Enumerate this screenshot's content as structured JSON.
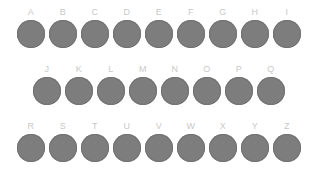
{
  "background_color": "#ffffff",
  "circle_color": "#7d7d7d",
  "circle_edge_color": "#717171",
  "label_color": "#c9c9c9",
  "board": {
    "name": "alphabet-circle-grid",
    "rows": [
      {
        "row_index": 1,
        "left": 17,
        "top": 7,
        "items": [
          {
            "label": "A"
          },
          {
            "label": "B"
          },
          {
            "label": "C"
          },
          {
            "label": "D"
          },
          {
            "label": "E"
          },
          {
            "label": "F"
          },
          {
            "label": "G"
          },
          {
            "label": "H"
          },
          {
            "label": "I"
          }
        ]
      },
      {
        "row_index": 2,
        "left": 33,
        "top": 64,
        "items": [
          {
            "label": "J"
          },
          {
            "label": "K"
          },
          {
            "label": "L"
          },
          {
            "label": "M"
          },
          {
            "label": "N"
          },
          {
            "label": "O"
          },
          {
            "label": "P"
          },
          {
            "label": "Q"
          }
        ]
      },
      {
        "row_index": 3,
        "left": 17,
        "top": 121,
        "items": [
          {
            "label": "R"
          },
          {
            "label": "S"
          },
          {
            "label": "T"
          },
          {
            "label": "U"
          },
          {
            "label": "V"
          },
          {
            "label": "W"
          },
          {
            "label": "X"
          },
          {
            "label": "Y"
          },
          {
            "label": "Z"
          }
        ]
      }
    ]
  }
}
